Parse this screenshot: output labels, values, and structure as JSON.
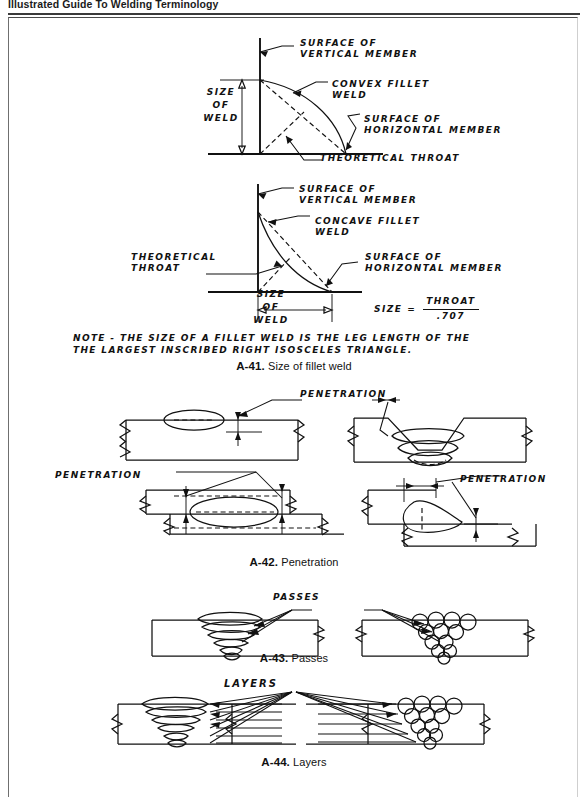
{
  "running_head": "Illustrated Guide To Welding Terminology",
  "figures": [
    {
      "id": "A-41",
      "number": "A-41.",
      "title": "Size of fillet weld",
      "caption": "A-41. Size of fillet weld",
      "labels": {
        "surface_vertical": "SURFACE OF\nVERTICAL MEMBER",
        "convex_fillet": "CONVEX FILLET\nWELD",
        "concave_fillet": "CONCAVE FILLET\nWELD",
        "surface_horizontal": "SURFACE OF\nHORIZONTAL MEMBER",
        "theoretical_throat": "THEORETICAL THROAT",
        "theoretical_throat_2": "THEORETICAL\nTHROAT",
        "size_of_weld_1": "SIZE\nOF\nWELD",
        "size_line_1": "SIZE",
        "size_line_2": "OF",
        "size_line_3": "WELD"
      },
      "formula": {
        "lhs": "SIZE =",
        "numerator": "THROAT",
        "denominator": ".707"
      },
      "note": "NOTE - THE SIZE OF A FILLET WELD IS THE LEG LENGTH OF THE\nTHE LARGEST INSCRIBED RIGHT ISOSCELES TRIANGLE.",
      "note_line_1": "NOTE - THE SIZE OF A FILLET WELD IS THE LEG LENGTH OF THE",
      "note_line_2": "THE LARGEST INSCRIBED RIGHT ISOSCELES TRIANGLE."
    },
    {
      "id": "A-42",
      "number": "A-42.",
      "title": "Penetration",
      "caption": "A-42. Penetration",
      "labels": {
        "penetration_top_left": "PENETRATION",
        "penetration_mid_left": "PENETRATION",
        "penetration_mid_right": "PENETRATION"
      }
    },
    {
      "id": "A-43",
      "number": "A-43.",
      "title": "Passes",
      "caption": "A-43. Passes",
      "labels": {
        "passes": "PASSES"
      }
    },
    {
      "id": "A-44",
      "number": "A-44.",
      "title": "Layers",
      "caption": "A-44. Layers",
      "labels": {
        "layers": "LAYERS"
      }
    }
  ],
  "colors": {
    "ink": "#111111",
    "page": "#ffffff",
    "rule": "#3a3a3a"
  }
}
